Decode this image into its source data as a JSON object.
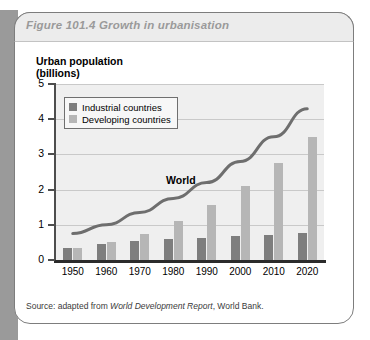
{
  "figure": {
    "title": "Figure 101.4  Growth in urbanisation",
    "source_prefix": "Source: adapted from ",
    "source_italic": "World Development Report",
    "source_suffix": ", World Bank."
  },
  "legend": {
    "position": "inside-top-left",
    "items": [
      {
        "label": "Industrial countries",
        "color": "#7e7e7e"
      },
      {
        "label": "Developing countries",
        "color": "#b6b6b6"
      }
    ]
  },
  "annotations": [
    {
      "text": "World",
      "x": 1990,
      "y": 2.0
    }
  ],
  "chart_data": {
    "type": "bar",
    "title": "Figure 101.4  Growth in urbanisation",
    "subtitle": "",
    "xlabel": "",
    "ylabel": "Urban population\n(billions)",
    "ylim": [
      0,
      5
    ],
    "yticks": [
      0,
      1,
      2,
      3,
      4,
      5
    ],
    "ytick_labels": [
      "0",
      "1",
      "2",
      "3",
      "4",
      "5"
    ],
    "grid": true,
    "grid_axis": "y",
    "legend_position": "inside-top-left",
    "categories": [
      "1950",
      "1960",
      "1970",
      "1980",
      "1990",
      "2000",
      "2010",
      "2020"
    ],
    "series": [
      {
        "name": "Industrial countries",
        "type": "bar",
        "color": "#7e7e7e",
        "values": [
          0.35,
          0.45,
          0.55,
          0.6,
          0.62,
          0.68,
          0.72,
          0.78
        ]
      },
      {
        "name": "Developing countries",
        "type": "bar",
        "color": "#b6b6b6",
        "values": [
          0.35,
          0.5,
          0.75,
          1.1,
          1.55,
          2.1,
          2.75,
          3.5
        ]
      },
      {
        "name": "World",
        "type": "line",
        "color": "#6e6e6e",
        "values": [
          0.75,
          1.0,
          1.35,
          1.75,
          2.2,
          2.8,
          3.5,
          4.3
        ]
      }
    ]
  }
}
